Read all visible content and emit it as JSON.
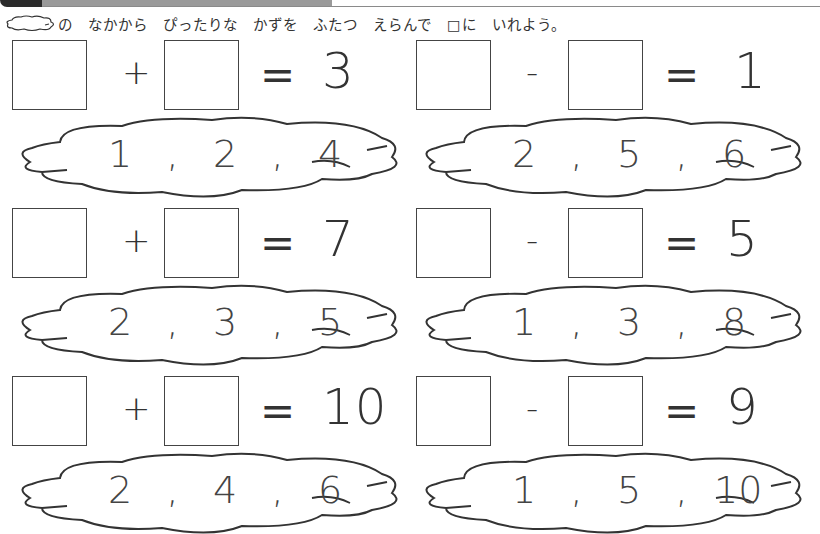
{
  "header": {
    "instruction": "の　なかから　ぴったりな　かずを　ふたつ　えらんで　□に　いれよう。",
    "cloud_icon": "cloud-icon"
  },
  "problems": [
    {
      "id": "p1",
      "left_blank": "",
      "operator": "+",
      "equals": "=",
      "result": "3",
      "choices": [
        "1",
        "2",
        "4"
      ]
    },
    {
      "id": "p2",
      "left_blank": "",
      "operator": "-",
      "equals": "=",
      "result": "1",
      "choices": [
        "2",
        "5",
        "6"
      ]
    },
    {
      "id": "p3",
      "left_blank": "",
      "operator": "+",
      "equals": "=",
      "result": "7",
      "choices": [
        "2",
        "3",
        "5"
      ]
    },
    {
      "id": "p4",
      "left_blank": "",
      "operator": "-",
      "equals": "=",
      "result": "5",
      "choices": [
        "1",
        "3",
        "8"
      ]
    },
    {
      "id": "p5",
      "left_blank": "",
      "operator": "+",
      "equals": "=",
      "result": "10",
      "choices": [
        "2",
        "4",
        "6"
      ]
    },
    {
      "id": "p6",
      "left_blank": "",
      "operator": "-",
      "equals": "=",
      "result": "9",
      "choices": [
        "1",
        "5",
        "10"
      ]
    }
  ],
  "separator": ","
}
